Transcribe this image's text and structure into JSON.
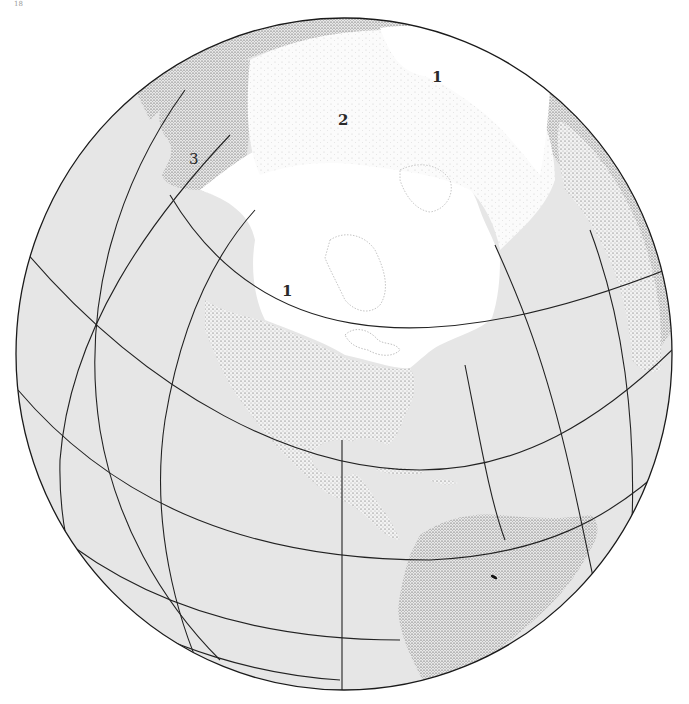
{
  "page": {
    "page_number": "18"
  },
  "map": {
    "projection": "orthographic globe, Northern Hemisphere centered on North America",
    "colors": {
      "ocean": "#e6e6e6",
      "ice_sheet": "#ffffff",
      "land_stipple": "#555555",
      "graticule": "#222222",
      "outline": "#1a1a1a"
    },
    "regions": [
      {
        "id": "ice-sheet-laurentide",
        "label": "1"
      },
      {
        "id": "sea-ice-arctic",
        "label": "2"
      },
      {
        "id": "ice-sheet-eurasian",
        "label": "1"
      },
      {
        "id": "alaska-beringia",
        "label": "3"
      }
    ],
    "labels": {
      "laurentide": "1",
      "arctic": "2",
      "eurasian": "1",
      "beringia": "3"
    }
  }
}
